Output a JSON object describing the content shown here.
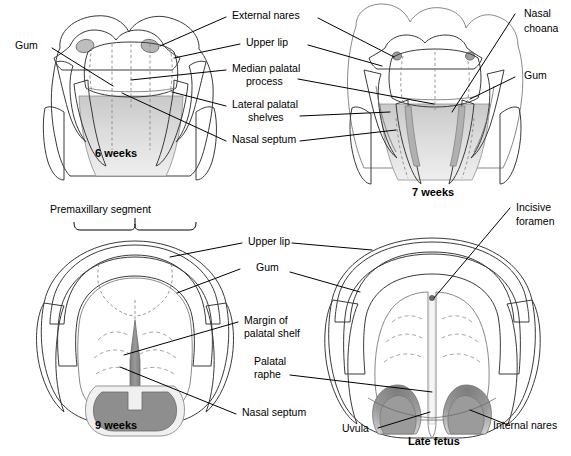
{
  "figure": {
    "background_color": "#ffffff",
    "line_color": "#000000"
  },
  "palette": {
    "outline": "#3a3a3a",
    "soft_outline": "#6b6b6b",
    "dashed_guide": "#8a8a96",
    "rugae": "#9a9aa6",
    "tissue_light": "#f2f2f2",
    "tissue_mid": "#dedede",
    "tissue_dark": "#bdbdbd",
    "septum_dark": "#8e8e8e",
    "cavity_shadow": "#a8a8a8"
  },
  "panels": [
    {
      "id": "six-weeks",
      "stage_label": "6 weeks"
    },
    {
      "id": "seven-weeks",
      "stage_label": "7 weeks"
    },
    {
      "id": "nine-weeks",
      "stage_label": "9 weeks"
    },
    {
      "id": "late-fetus",
      "stage_label": "Late fetus"
    }
  ],
  "labels": {
    "gum_top_left": "Gum",
    "external_nares": "External nares",
    "upper_lip_top": "Upper lip",
    "median_palatal_process_l1": "Median palatal",
    "median_palatal_process_l2": "process",
    "lateral_palatal_shelves_l1": "Lateral palatal",
    "lateral_palatal_shelves_l2": "shelves",
    "nasal_septum_top": "Nasal septum",
    "nasal_choana_l1": "Nasal",
    "nasal_choana_l2": "choana",
    "gum_top_right": "Gum",
    "premaxillary_segment": "Premaxillary segment",
    "upper_lip_bottom": "Upper lip",
    "gum_bottom": "Gum",
    "margin_palatal_shelf_l1": "Margin of",
    "margin_palatal_shelf_l2": "palatal shelf",
    "palatal_raphe_l1": "Palatal",
    "palatal_raphe_l2": "raphe",
    "nasal_septum_bottom": "Nasal septum",
    "incisive_foramen_l1": "Incisive",
    "incisive_foramen_l2": "foramen",
    "uvula": "Uvula",
    "internal_nares": "Internal nares"
  }
}
